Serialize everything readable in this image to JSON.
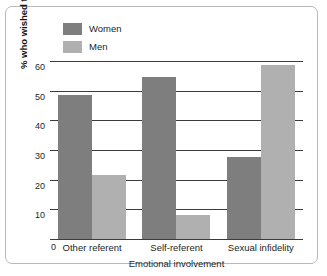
{
  "chart_data": {
    "type": "bar",
    "title": "",
    "categories": [
      "Other referent",
      "Self-referent",
      "Sexual infidelity"
    ],
    "series": [
      {
        "name": "Women",
        "values": [
          49,
          55,
          28
        ],
        "color": "#7e7e7e"
      },
      {
        "name": "Men",
        "values": [
          22,
          8.5,
          59
        ],
        "color": "#b0b0b0"
      }
    ],
    "xlabel": "Emotional involvement",
    "ylabel": "% who wished to ask type of question",
    "ylim": [
      0,
      60
    ],
    "yticks": [
      0,
      10,
      20,
      30,
      40,
      50,
      60
    ],
    "ytick_labels": [
      "0",
      "10",
      "20",
      "30",
      "40",
      "50",
      "60"
    ],
    "grid": true,
    "legend_position": "top-left"
  },
  "legend": {
    "items": [
      {
        "label": "Women",
        "color": "#7e7e7e"
      },
      {
        "label": "Men",
        "color": "#b0b0b0"
      }
    ]
  },
  "axis": {
    "y_title": "% who wished to ask type of question",
    "x_title": "Emotional involvement",
    "zero_label": "0",
    "ticks": [
      "60",
      "50",
      "40",
      "30",
      "20",
      "10"
    ]
  }
}
